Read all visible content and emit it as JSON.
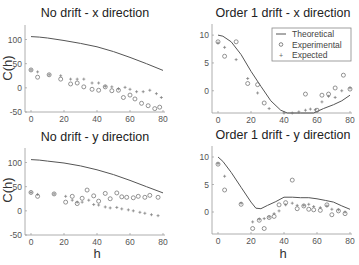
{
  "figure": {
    "background": "#ffffff",
    "line_color": "#555555",
    "marker_color": "#777777"
  },
  "legend": {
    "entries": [
      {
        "label": "Theoretical",
        "style": "line"
      },
      {
        "label": "Experimental",
        "style": "circle"
      },
      {
        "label": "Expected",
        "style": "plus"
      }
    ]
  },
  "chart_data": [
    {
      "type": "line",
      "title": "No drift - x direction",
      "xlabel": "",
      "ylabel": "C(h)",
      "xlim": [
        0,
        80
      ],
      "ylim": [
        -50,
        130
      ],
      "xticks": [
        0,
        20,
        40,
        60,
        80
      ],
      "yticks": [
        -50,
        0,
        50,
        100
      ],
      "ytick_labels": [
        "-50",
        "0",
        "50",
        "100"
      ],
      "grid": false,
      "legend": false,
      "series": [
        {
          "name": "Theoretical",
          "style": "line",
          "x": [
            0,
            5,
            10,
            20,
            30,
            40,
            50,
            60,
            70,
            80
          ],
          "y": [
            106,
            105,
            103,
            98,
            92,
            85,
            75,
            63,
            50,
            36
          ]
        },
        {
          "name": "Experimental",
          "style": "circle",
          "x": [
            0,
            4,
            11,
            18,
            24,
            28,
            32,
            37,
            41,
            45,
            49,
            53,
            56,
            60,
            63,
            67,
            71,
            75,
            78
          ],
          "y": [
            37,
            22,
            27,
            18,
            8,
            10,
            2,
            -3,
            -5,
            2,
            -6,
            -5,
            -20,
            -15,
            -23,
            -32,
            -37,
            -43,
            -40
          ]
        },
        {
          "name": "Expected",
          "style": "plus",
          "x": [
            0,
            4,
            11,
            18,
            24,
            28,
            32,
            37,
            41,
            45,
            49,
            53,
            57,
            60,
            64,
            68,
            72,
            76,
            79
          ],
          "y": [
            37,
            33,
            27,
            25,
            18,
            18,
            18,
            10,
            10,
            3,
            2,
            -2,
            1,
            -3,
            -8,
            -8,
            -5,
            -12,
            -20
          ]
        }
      ]
    },
    {
      "type": "line",
      "title": "Order 1 drift - x direction",
      "xlabel": "",
      "ylabel": "",
      "xlim": [
        0,
        80
      ],
      "ylim": [
        -4,
        12
      ],
      "xticks": [
        0,
        20,
        40,
        60,
        80
      ],
      "yticks": [
        0,
        5,
        10
      ],
      "ytick_labels": [
        "0",
        "5",
        "10"
      ],
      "grid": false,
      "legend": true,
      "legend_position": "upper right",
      "series": [
        {
          "name": "Theoretical",
          "style": "line",
          "x": [
            0,
            3,
            8,
            14,
            20,
            26,
            32,
            38,
            42,
            50,
            58,
            64,
            70,
            75,
            80
          ],
          "y": [
            10,
            9.8,
            8.8,
            6.5,
            3.5,
            0.8,
            -1.8,
            -3.5,
            -4,
            -4,
            -4,
            -3.2,
            -2.5,
            -1.8,
            -0.8
          ]
        },
        {
          "name": "Experimental",
          "style": "circle",
          "x": [
            0,
            4,
            11,
            18,
            24,
            28,
            53,
            60,
            63,
            67,
            71,
            76,
            80
          ],
          "y": [
            8.8,
            6.2,
            8.8,
            1.3,
            1.1,
            -2.2,
            -0.6,
            -3.5,
            -0.8,
            -0.6,
            0.5,
            2.8,
            0.3
          ]
        },
        {
          "name": "Expected",
          "style": "plus",
          "x": [
            0,
            4,
            11,
            18,
            24,
            31,
            40,
            45,
            49,
            53,
            56,
            59,
            63,
            67,
            71,
            75,
            80
          ],
          "y": [
            8.6,
            7.8,
            5.6,
            2.2,
            -0.4,
            -3.2,
            -4,
            -4,
            -3.8,
            -3.5,
            -3.3,
            -3.4,
            -2,
            -1,
            -1.2,
            0,
            0.5
          ]
        }
      ]
    },
    {
      "type": "line",
      "title": "No drift - y direction",
      "xlabel": "h",
      "ylabel": "C(h)",
      "xlim": [
        0,
        80
      ],
      "ylim": [
        -50,
        130
      ],
      "xticks": [
        0,
        20,
        40,
        60,
        80
      ],
      "yticks": [
        -50,
        0,
        50,
        100
      ],
      "ytick_labels": [
        "-50",
        "0",
        "50",
        "100"
      ],
      "grid": false,
      "legend": false,
      "series": [
        {
          "name": "Theoretical",
          "style": "line",
          "x": [
            0,
            5,
            10,
            20,
            30,
            40,
            50,
            60,
            70,
            80
          ],
          "y": [
            106,
            105,
            103,
            99,
            93,
            85,
            75,
            63,
            50,
            37
          ]
        },
        {
          "name": "Experimental",
          "style": "circle",
          "x": [
            0,
            4,
            14,
            21,
            25,
            28,
            31,
            34,
            38,
            41,
            45,
            48,
            52,
            55,
            58,
            62,
            65,
            69,
            72,
            77
          ],
          "y": [
            38,
            30,
            35,
            18,
            30,
            15,
            26,
            43,
            31,
            20,
            36,
            25,
            37,
            29,
            28,
            27,
            30,
            28,
            32,
            28
          ]
        },
        {
          "name": "Expected",
          "style": "plus",
          "x": [
            0,
            4,
            14,
            21,
            25,
            28,
            31,
            35,
            38,
            41,
            45,
            48,
            52,
            55,
            59,
            62,
            66,
            69,
            73,
            77
          ],
          "y": [
            38,
            34,
            35,
            30,
            22,
            18,
            18,
            22,
            13,
            12,
            8,
            6,
            7,
            4,
            2,
            0,
            -3,
            -5,
            -8,
            -10
          ]
        }
      ]
    },
    {
      "type": "line",
      "title": "Order 1 drift - y direction",
      "xlabel": "h",
      "ylabel": "",
      "xlim": [
        0,
        80
      ],
      "ylim": [
        -4,
        12
      ],
      "xticks": [
        0,
        20,
        40,
        60,
        80
      ],
      "yticks": [
        0,
        5,
        10
      ],
      "ytick_labels": [
        "0",
        "5",
        "10"
      ],
      "grid": false,
      "legend": false,
      "series": [
        {
          "name": "Theoretical",
          "style": "line",
          "x": [
            0,
            3,
            8,
            14,
            20,
            23,
            26,
            30,
            35,
            40,
            45,
            50,
            55,
            60,
            65,
            70,
            75,
            80
          ],
          "y": [
            10,
            9.2,
            7.2,
            4.5,
            1.8,
            0.7,
            0.6,
            1.2,
            1.9,
            2.7,
            2.7,
            2.6,
            2.6,
            2.4,
            2.1,
            1.8,
            1.1,
            0.5
          ]
        },
        {
          "name": "Experimental",
          "style": "circle",
          "x": [
            0,
            4,
            14,
            21,
            25,
            28,
            31,
            34,
            37,
            41,
            45,
            48,
            52,
            55,
            58,
            62,
            66,
            69,
            73,
            77
          ],
          "y": [
            8.7,
            4,
            1.4,
            -3,
            -1.5,
            -3,
            -1,
            -0.8,
            1.3,
            1.7,
            5.8,
            0.6,
            1.1,
            0.5,
            0.4,
            0.3,
            1.3,
            -0.5,
            0.2,
            -0.3
          ]
        },
        {
          "name": "Expected",
          "style": "plus",
          "x": [
            0,
            4,
            14,
            21,
            25,
            28,
            31,
            34,
            37,
            41,
            45,
            48,
            52,
            55,
            58,
            62,
            66,
            69,
            73,
            77
          ],
          "y": [
            8.8,
            6.5,
            1.6,
            -1.8,
            -1.3,
            -1.2,
            -0.9,
            -0.3,
            0.2,
            1.3,
            1.6,
            1.2,
            1.2,
            1.4,
            1,
            0.8,
            1.1,
            0.5,
            0.4,
            0
          ]
        }
      ]
    }
  ]
}
